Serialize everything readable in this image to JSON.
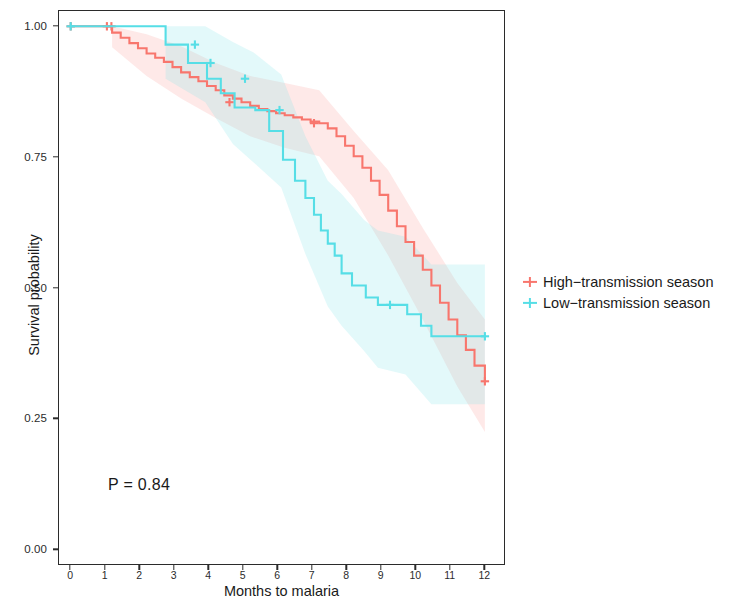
{
  "chart_data": {
    "type": "line",
    "title": "",
    "subtitle": "",
    "xlabel": "Months to malaria",
    "ylabel": "Survival probability",
    "xlim": [
      -0.35,
      12.6
    ],
    "ylim": [
      -0.03,
      1.03
    ],
    "grid": false,
    "legend_position": "right",
    "annotations": [
      {
        "name": "p-value",
        "text": "P = 0.84",
        "x": 1.0,
        "y": 0.16
      }
    ],
    "xticks": [
      0,
      1,
      2,
      3,
      4,
      5,
      6,
      7,
      8,
      9,
      10,
      11,
      12
    ],
    "xtick_labels": [
      "0",
      "1",
      "2",
      "3",
      "4",
      "5",
      "6",
      "7",
      "8",
      "9",
      "10",
      "11",
      "12"
    ],
    "yticks": [
      0.0,
      0.25,
      0.5,
      0.75,
      1.0
    ],
    "ytick_labels": [
      "0.00",
      "0.25",
      "0.50",
      "0.75",
      "1.00"
    ],
    "colors": {
      "high_transmission": "#F8766D",
      "low_transmission": "#56DEE6",
      "high_transmission_band": "#F8766D",
      "low_transmission_band": "#7FE3EA",
      "axis": "#2b2b2b",
      "text": "#1a1a1a",
      "background": "#ffffff"
    },
    "series": [
      {
        "name": "High-transmission season",
        "color": "#F8766D",
        "step": "post",
        "censor_marks": [
          {
            "x": 0.0,
            "y": 1.0
          },
          {
            "x": 1.05,
            "y": 1.0
          },
          {
            "x": 1.18,
            "y": 1.0
          },
          {
            "x": 4.6,
            "y": 0.855
          },
          {
            "x": 7.05,
            "y": 0.815
          },
          {
            "x": 12.0,
            "y": 0.322
          }
        ],
        "x": [
          0.0,
          1.0,
          1.2,
          1.45,
          1.7,
          1.95,
          2.2,
          2.45,
          2.7,
          2.95,
          3.2,
          3.45,
          3.7,
          3.95,
          4.2,
          4.45,
          4.7,
          4.95,
          5.2,
          5.45,
          5.7,
          5.95,
          6.2,
          6.45,
          6.7,
          6.95,
          7.2,
          7.45,
          7.7,
          7.95,
          8.2,
          8.45,
          8.7,
          8.95,
          9.2,
          9.45,
          9.7,
          9.95,
          10.2,
          10.45,
          10.7,
          10.95,
          11.2,
          11.45,
          11.7,
          12.0
        ],
        "y": [
          1.0,
          1.0,
          0.988,
          0.978,
          0.968,
          0.958,
          0.948,
          0.94,
          0.932,
          0.922,
          0.912,
          0.903,
          0.895,
          0.886,
          0.878,
          0.868,
          0.862,
          0.855,
          0.848,
          0.842,
          0.838,
          0.834,
          0.83,
          0.826,
          0.822,
          0.818,
          0.815,
          0.805,
          0.79,
          0.772,
          0.752,
          0.73,
          0.705,
          0.678,
          0.648,
          0.618,
          0.588,
          0.562,
          0.535,
          0.505,
          0.472,
          0.44,
          0.41,
          0.382,
          0.352,
          0.322
        ]
      },
      {
        "name": "Low-transmission season",
        "color": "#56DEE6",
        "step": "post",
        "censor_marks": [
          {
            "x": 0.0,
            "y": 1.0
          },
          {
            "x": 3.6,
            "y": 0.965
          },
          {
            "x": 4.05,
            "y": 0.93
          },
          {
            "x": 5.05,
            "y": 0.9
          },
          {
            "x": 6.05,
            "y": 0.84
          },
          {
            "x": 9.25,
            "y": 0.468
          },
          {
            "x": 12.0,
            "y": 0.408
          }
        ],
        "x": [
          0.0,
          2.7,
          2.75,
          3.35,
          3.4,
          3.9,
          3.95,
          4.3,
          4.35,
          4.7,
          4.75,
          5.3,
          5.35,
          5.7,
          5.75,
          6.1,
          6.15,
          6.45,
          6.5,
          6.75,
          6.8,
          7.0,
          7.05,
          7.2,
          7.25,
          7.4,
          7.45,
          7.6,
          7.65,
          7.8,
          7.85,
          8.1,
          8.15,
          8.5,
          8.55,
          8.85,
          8.9,
          9.7,
          9.75,
          10.1,
          10.15,
          10.4,
          10.45,
          12.0
        ],
        "y": [
          1.0,
          1.0,
          0.965,
          0.965,
          0.93,
          0.93,
          0.9,
          0.9,
          0.872,
          0.872,
          0.845,
          0.845,
          0.84,
          0.84,
          0.8,
          0.8,
          0.745,
          0.745,
          0.705,
          0.705,
          0.672,
          0.672,
          0.64,
          0.64,
          0.61,
          0.61,
          0.585,
          0.585,
          0.562,
          0.562,
          0.528,
          0.528,
          0.505,
          0.505,
          0.482,
          0.482,
          0.468,
          0.468,
          0.45,
          0.45,
          0.428,
          0.428,
          0.408,
          0.408
        ]
      }
    ],
    "confidence_bands": [
      {
        "name": "High-transmission season 95% CI",
        "color": "#F8766D",
        "opacity": 0.16,
        "x": [
          1.2,
          2.2,
          3.2,
          4.2,
          5.2,
          6.2,
          7.2,
          8.2,
          9.2,
          10.2,
          11.2,
          12.0
        ],
        "lower": [
          0.96,
          0.905,
          0.862,
          0.825,
          0.79,
          0.768,
          0.752,
          0.672,
          0.562,
          0.44,
          0.312,
          0.225
        ],
        "upper": [
          1.0,
          0.985,
          0.962,
          0.93,
          0.905,
          0.892,
          0.878,
          0.8,
          0.725,
          0.615,
          0.51,
          0.44
        ]
      },
      {
        "name": "Low-transmission season 95% CI",
        "color": "#7FE3EA",
        "opacity": 0.22,
        "x": [
          2.75,
          3.9,
          4.7,
          5.3,
          6.1,
          6.8,
          7.45,
          7.85,
          8.5,
          8.9,
          9.7,
          10.45,
          12.0
        ],
        "lower": [
          0.9,
          0.855,
          0.775,
          0.74,
          0.692,
          0.565,
          0.465,
          0.428,
          0.38,
          0.348,
          0.335,
          0.278,
          0.278
        ],
        "upper": [
          1.0,
          1.0,
          0.97,
          0.95,
          0.908,
          0.79,
          0.705,
          0.68,
          0.63,
          0.61,
          0.598,
          0.545,
          0.545
        ]
      }
    ]
  },
  "legend": {
    "entries": [
      {
        "label": "High−transmission season",
        "color": "#F8766D",
        "marker": "plus-marker"
      },
      {
        "label": "Low−transmission season",
        "color": "#56DEE6",
        "marker": "plus-marker"
      }
    ]
  },
  "axes": {
    "x_title": "Months to malaria",
    "y_title": "Survival probability",
    "x_labels": [
      "0",
      "1",
      "2",
      "3",
      "4",
      "5",
      "6",
      "7",
      "8",
      "9",
      "10",
      "11",
      "12"
    ],
    "y_labels": [
      "1.00",
      "0.75",
      "0.50",
      "0.25",
      "0.00"
    ]
  },
  "annotation": {
    "p_value": "P = 0.84"
  }
}
